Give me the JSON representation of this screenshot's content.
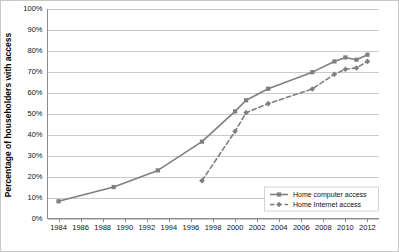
{
  "chart_data": {
    "type": "line",
    "title": "",
    "xlabel": "",
    "ylabel": "Percentage of householders with access",
    "xlim": [
      1983,
      2013
    ],
    "ylim": [
      0,
      100
    ],
    "grid": true,
    "legend_position": "bottom-right",
    "x_tick_labels": [
      "1984",
      "1986",
      "1988",
      "1990",
      "1992",
      "1994",
      "1996",
      "1998",
      "2000",
      "2002",
      "2004",
      "2006",
      "2008",
      "2010",
      "2012"
    ],
    "x_ticks": [
      1984,
      1986,
      1988,
      1990,
      1992,
      1994,
      1996,
      1998,
      2000,
      2002,
      2004,
      2006,
      2008,
      2010,
      2012
    ],
    "y_tick_labels": [
      "0%",
      "10%",
      "20%",
      "30%",
      "40%",
      "50%",
      "60%",
      "70%",
      "80%",
      "90%",
      "100%"
    ],
    "y_ticks": [
      0,
      10,
      20,
      30,
      40,
      50,
      60,
      70,
      80,
      90,
      100
    ],
    "series": [
      {
        "name": "Home computer access",
        "style": "solid",
        "marker": "square",
        "color": "#7f7f7f",
        "points": [
          {
            "x": 1984,
            "y": 8.2
          },
          {
            "x": 1989,
            "y": 15.0
          },
          {
            "x": 1993,
            "y": 22.9
          },
          {
            "x": 1997,
            "y": 36.6
          },
          {
            "x": 2000,
            "y": 51.0
          },
          {
            "x": 2001,
            "y": 56.3
          },
          {
            "x": 2003,
            "y": 61.8
          },
          {
            "x": 2007,
            "y": 69.7
          },
          {
            "x": 2009,
            "y": 74.8
          },
          {
            "x": 2010,
            "y": 76.7
          },
          {
            "x": 2011,
            "y": 75.6
          },
          {
            "x": 2012,
            "y": 78.0
          }
        ]
      },
      {
        "name": "Home Internet access",
        "style": "dashed",
        "marker": "diamond",
        "color": "#7f7f7f",
        "points": [
          {
            "x": 1997,
            "y": 18.0
          },
          {
            "x": 2000,
            "y": 41.5
          },
          {
            "x": 2001,
            "y": 50.4
          },
          {
            "x": 2003,
            "y": 54.7
          },
          {
            "x": 2007,
            "y": 61.7
          },
          {
            "x": 2009,
            "y": 68.7
          },
          {
            "x": 2010,
            "y": 71.1
          },
          {
            "x": 2011,
            "y": 71.7
          },
          {
            "x": 2012,
            "y": 74.8
          }
        ]
      }
    ]
  },
  "legend": {
    "items": [
      {
        "label": "Home computer access"
      },
      {
        "label": "Home Internet access"
      }
    ]
  }
}
